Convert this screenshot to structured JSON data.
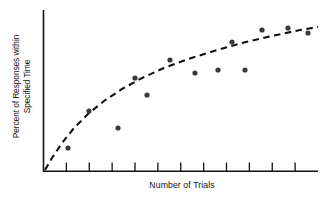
{
  "chart_data": {
    "type": "scatter",
    "title": "",
    "xlabel": "Number of Trials",
    "ylabel_line1": "Percent of Responses within",
    "ylabel_line2": "Specified Time",
    "ylabel": "Percent of Responses within Specified Time",
    "grid": false,
    "legend": null,
    "xlim": [
      0,
      11
    ],
    "ylim": [
      0,
      100
    ],
    "x_tick_count": 11,
    "x_tick_labels": [],
    "y_tick_labels": [],
    "axis_style": "open-left-and-bottom",
    "marker_color": "#3a3a3a",
    "marker_radius": 2.6,
    "curve_color": "#111111",
    "curve_style": "dashed",
    "series": [
      {
        "name": "Observed responses",
        "x": [
          0.95,
          1.65,
          2.45,
          2.95,
          3.35,
          3.85,
          4.6,
          5.25,
          5.95,
          6.3,
          7.1,
          7.9,
          8.9,
          9.65
        ],
        "y": [
          17,
          38,
          26,
          57,
          47,
          63,
          56,
          53,
          79,
          55,
          73,
          80,
          81,
          77
        ],
        "points_px": [
          {
            "x": 68,
            "y": 148
          },
          {
            "x": 89,
            "y": 111
          },
          {
            "x": 118,
            "y": 128
          },
          {
            "x": 135,
            "y": 78
          },
          {
            "x": 147,
            "y": 95
          },
          {
            "x": 170,
            "y": 60
          },
          {
            "x": 195,
            "y": 73
          },
          {
            "x": 218,
            "y": 70
          },
          {
            "x": 232,
            "y": 42
          },
          {
            "x": 245,
            "y": 70
          },
          {
            "x": 262,
            "y": 30
          },
          {
            "x": 288,
            "y": 28
          },
          {
            "x": 308,
            "y": 33
          }
        ]
      }
    ],
    "trend_curve": {
      "name": "Fitted learning curve",
      "shape": "negatively accelerated / logarithmic",
      "points_px": [
        {
          "x": 45,
          "y": 170
        },
        {
          "x": 52,
          "y": 158
        },
        {
          "x": 62,
          "y": 143
        },
        {
          "x": 74,
          "y": 128
        },
        {
          "x": 88,
          "y": 114
        },
        {
          "x": 104,
          "y": 101
        },
        {
          "x": 122,
          "y": 89
        },
        {
          "x": 142,
          "y": 78
        },
        {
          "x": 164,
          "y": 68
        },
        {
          "x": 188,
          "y": 59
        },
        {
          "x": 214,
          "y": 51
        },
        {
          "x": 242,
          "y": 43
        },
        {
          "x": 272,
          "y": 36
        },
        {
          "x": 300,
          "y": 30
        },
        {
          "x": 318,
          "y": 27
        }
      ]
    }
  },
  "figure": {
    "caption": "",
    "xlabel": "Number of Trials",
    "ylabel_line1": "Percent of Responses within",
    "ylabel_line2": "Specified Time"
  }
}
